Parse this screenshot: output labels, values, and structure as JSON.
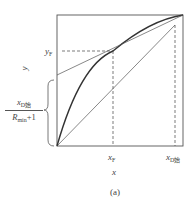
{
  "figure": {
    "caption": "(a)",
    "x_axis_label": "x",
    "y_axis_label": "y",
    "labels": {
      "yF": {
        "main": "y",
        "sub": "F"
      },
      "xF": {
        "main": "x",
        "sub": "F"
      },
      "xD": {
        "main": "x",
        "sub": "D始"
      },
      "intercept_num_main": "x",
      "intercept_num_sub": "D始",
      "intercept_den_main": "R",
      "intercept_den_sub": "min",
      "intercept_den_tail": "+1"
    },
    "elements": [
      "square plot frame",
      "equilibrium curve (thick, concave)",
      "diagonal line y=x",
      "operating line from intercept to (xD, xD) through (xF, yF)",
      "dashed lines at xF / yF and xD",
      "curly brace marking intercept on y-axis"
    ]
  }
}
